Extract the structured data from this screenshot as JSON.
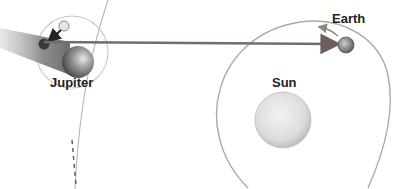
{
  "diagram": {
    "labels": {
      "jupiter": "Jupiter",
      "earth": "Earth",
      "sun": "Sun"
    },
    "bodies": [
      {
        "name": "Sun",
        "role": "central star"
      },
      {
        "name": "Earth",
        "role": "observer planet"
      },
      {
        "name": "Jupiter",
        "role": "planet with moon"
      },
      {
        "name": "Moon",
        "role": "moon of Jupiter entering shadow"
      }
    ],
    "arrows": [
      {
        "from": "Jupiter moon",
        "to": "Earth",
        "meaning": "light path"
      },
      {
        "from": "moon position 1",
        "to": "moon position 2",
        "meaning": "moon motion into shadow"
      },
      {
        "on": "Earth orbit",
        "meaning": "orbital direction"
      }
    ],
    "colors": {
      "light_path": "#7a6a6a",
      "orbit": "#b0b0b0",
      "sun": "#e2e2e2",
      "shadow": "#8a8a8a",
      "text": "#222222"
    }
  }
}
